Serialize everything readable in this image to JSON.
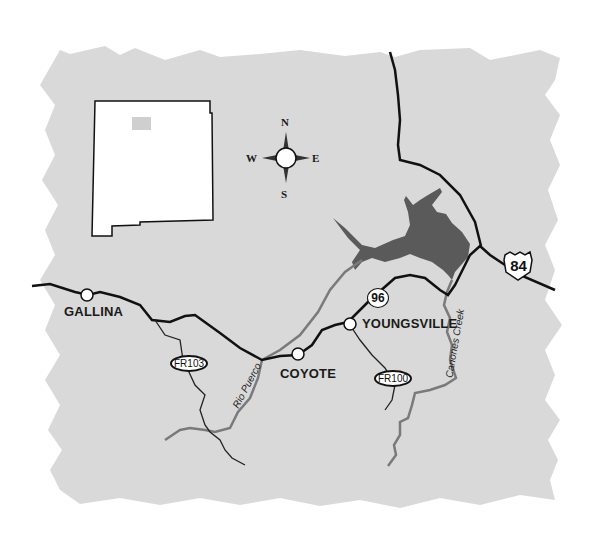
{
  "map": {
    "background_color": "#d9d9d9",
    "water_color": "#5a5a5a",
    "river_color": "#7a7a7a",
    "road_color": "#111111",
    "inset": {
      "name": "new-mexico-state-outline",
      "highlight_color": "#d0d0d0"
    },
    "compass": {
      "n": "N",
      "s": "S",
      "e": "E",
      "w": "W"
    },
    "towns": [
      {
        "name": "GALLINA"
      },
      {
        "name": "COYOTE"
      },
      {
        "name": "YOUNGSVILLE"
      }
    ],
    "routes": {
      "us84": "84",
      "state96": "96",
      "fr103": "FR103",
      "fr100": "FR100"
    },
    "rivers": {
      "rio_puerco": "Rio Puerco",
      "canones_creek": "Canones Creek"
    }
  }
}
